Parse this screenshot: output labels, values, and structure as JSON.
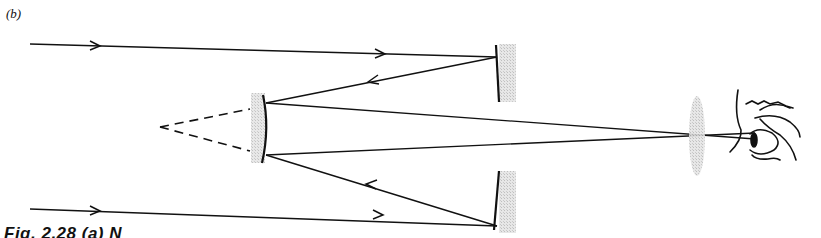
{
  "figure": {
    "panel_label": "(b)",
    "caption_fragment": "Fig. 2.28   (a) N"
  },
  "elements": {
    "incoming_rays": 2,
    "primary_mirror": "concave primary mirror",
    "secondary_mirror": "convex secondary mirror",
    "virtual_focus": "dashed construction lines",
    "eyepiece": "lens",
    "observer": "eye"
  },
  "colors": {
    "ink": "#111111",
    "mirror_shade": "#c8c8c8",
    "background": "#ffffff"
  }
}
